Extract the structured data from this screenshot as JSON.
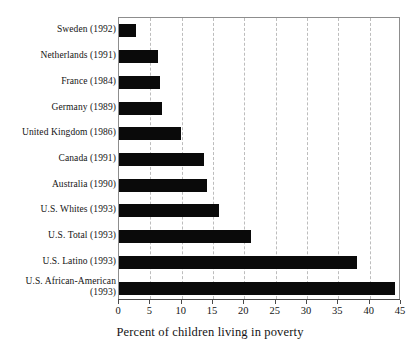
{
  "chart_data": {
    "type": "bar",
    "orientation": "horizontal",
    "title": "",
    "xlabel": "Percent of children living in poverty",
    "ylabel": "",
    "xlim": [
      0,
      45
    ],
    "xticks": [
      0,
      5,
      10,
      15,
      20,
      25,
      30,
      35,
      40,
      45
    ],
    "grid": true,
    "grid_axis": "x",
    "grid_style": "dashed",
    "legend": false,
    "bar_color": "#0a0a0a",
    "categories": [
      "Sweden (1992)",
      "Netherlands (1991)",
      "France (1984)",
      "Germany (1989)",
      "United Kingdom (1986)",
      "Canada (1991)",
      "Australia (1990)",
      "U.S. Whites (1993)",
      "U.S. Total (1993)",
      "U.S. Latino (1993)",
      "U.S. African-American\n(1993)"
    ],
    "values": [
      2.7,
      6.2,
      6.5,
      6.8,
      9.9,
      13.5,
      14.0,
      16.0,
      21.0,
      37.9,
      44.0
    ]
  },
  "axis": {
    "tick_labels": [
      "0",
      "5",
      "10",
      "15",
      "20",
      "25",
      "30",
      "35",
      "40",
      "45"
    ],
    "x_title": "Percent of children living in poverty"
  }
}
